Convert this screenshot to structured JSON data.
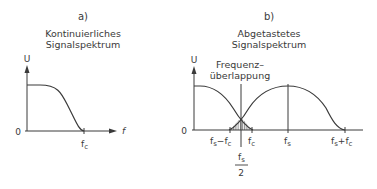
{
  "panel_a": {
    "label": "a)",
    "title_line1": "Kontinuierliches",
    "title_line2": "Signalspektrum",
    "y_axis_label": "U",
    "x_axis_label": "f",
    "origin_label": "0",
    "tick_fc": "f",
    "tick_fc_sub": "c"
  },
  "panel_b": {
    "label": "b)",
    "title_line1": "Abgetastetes",
    "title_line2": "Signalspektrum",
    "y_axis_label": "U",
    "origin_label": "0",
    "annotation_line1": "Frequenz–",
    "annotation_line2": "überlappung",
    "tick_fs_minus_fc": {
      "f1": "f",
      "s1": "s",
      "op": "−",
      "f2": "f",
      "s2": "c"
    },
    "tick_fc": {
      "f": "f",
      "s": "c"
    },
    "tick_fs": {
      "f": "f",
      "s": "s"
    },
    "tick_fs_plus_fc": {
      "f1": "f",
      "s1": "s",
      "op": "+",
      "f2": "f",
      "s2": "c"
    },
    "half_fs": {
      "num_f": "f",
      "num_s": "s",
      "den": "2"
    }
  },
  "colors": {
    "line": "#3a3a3a",
    "background": "#ffffff"
  }
}
